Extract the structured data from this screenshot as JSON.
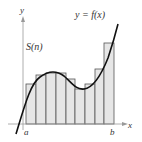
{
  "diagram": {
    "function_label": "y = f(x)",
    "sum_label": "S(n)",
    "x_axis_label": "x",
    "y_axis_label": "y",
    "left_bound_label": "a",
    "right_bound_label": "b",
    "rectangle_count": 9,
    "rectangle_fill": "#e6e6e6",
    "rectangle_stroke": "#555555",
    "curve_color": "#111111"
  }
}
